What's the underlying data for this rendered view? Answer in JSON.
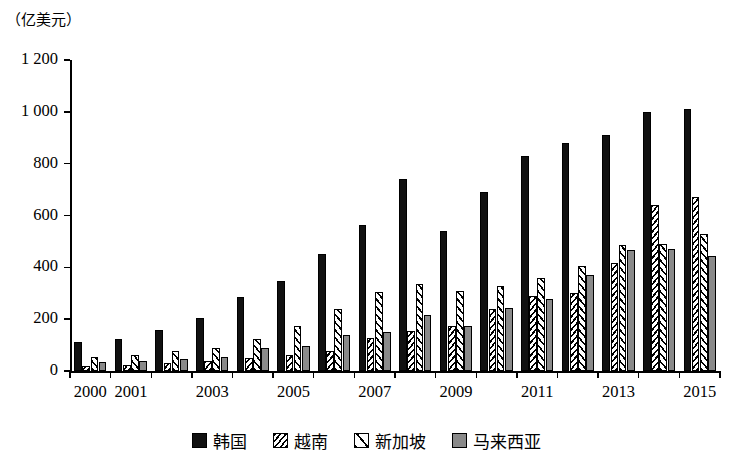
{
  "chart_data": {
    "type": "bar",
    "title": "",
    "subtitle": "",
    "unit_caption": "（亿美元）",
    "xlabel": "",
    "ylabel": "",
    "ylim": [
      0,
      1200
    ],
    "yticks": [
      0,
      200,
      400,
      600,
      800,
      1000,
      1200
    ],
    "ytick_labels": [
      "0",
      "200",
      "400",
      "600",
      "800",
      "1 000",
      "1 200"
    ],
    "grid": false,
    "legend_position": "bottom",
    "categories": [
      "2000",
      "2001",
      "2002",
      "2003",
      "2004",
      "2005",
      "2006",
      "2007",
      "2008",
      "2009",
      "2010",
      "2011",
      "2012",
      "2013",
      "2014",
      "2015"
    ],
    "xtick_labels_shown": [
      "2000",
      "2001",
      "",
      "2003",
      "",
      "2005",
      "",
      "2007",
      "",
      "2009",
      "",
      "2011",
      "",
      "2013",
      "",
      "2015"
    ],
    "series": [
      {
        "name": "韩国",
        "pattern": "solid-black",
        "color": "#111111",
        "values": [
          112,
          122,
          160,
          205,
          285,
          348,
          450,
          565,
          740,
          542,
          692,
          830,
          878,
          910,
          1000,
          1010
        ]
      },
      {
        "name": "越南",
        "pattern": "diagonal-hatch-dense",
        "color": "#000000",
        "values": [
          18,
          22,
          30,
          38,
          52,
          62,
          78,
          128,
          155,
          172,
          240,
          288,
          300,
          418,
          640,
          670
        ]
      },
      {
        "name": "新加坡",
        "pattern": "diagonal-hatch-light",
        "color": "#000000",
        "values": [
          55,
          60,
          78,
          88,
          122,
          172,
          238,
          305,
          335,
          310,
          328,
          358,
          405,
          485,
          490,
          530
        ]
      },
      {
        "name": "马来西亚",
        "pattern": "solid-gray",
        "color": "#8a8a8a",
        "values": [
          33,
          38,
          48,
          56,
          88,
          98,
          138,
          152,
          218,
          172,
          242,
          278,
          372,
          468,
          472,
          445
        ]
      }
    ]
  },
  "legend": {
    "items": [
      {
        "label": "韩国"
      },
      {
        "label": "越南"
      },
      {
        "label": "新加坡"
      },
      {
        "label": "马来西亚"
      }
    ]
  }
}
